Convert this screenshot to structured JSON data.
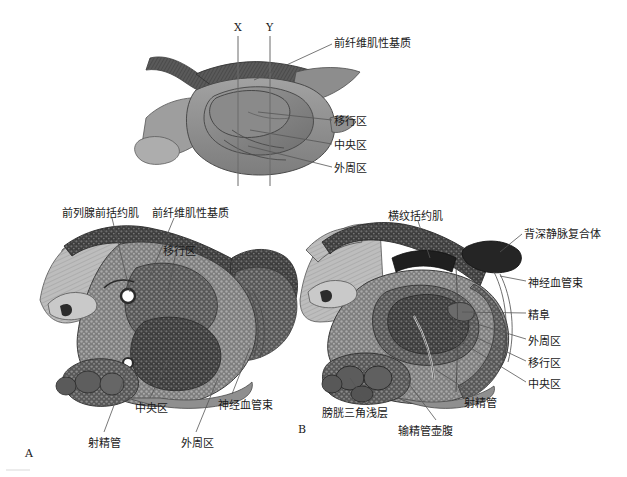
{
  "figure": {
    "title_zones": [
      "前纤维肌性基质",
      "移行区",
      "中央区",
      "外周区"
    ],
    "section_markers": {
      "x": "X",
      "y": "Y"
    },
    "panel_markers": {
      "a": "A",
      "b": "B"
    }
  },
  "top_panel": {
    "labels": [
      {
        "key": "afms",
        "text": "前纤维肌性基质",
        "x": 334,
        "y": 38
      },
      {
        "key": "transition",
        "text": "移行区",
        "x": 334,
        "y": 116
      },
      {
        "key": "central",
        "text": "中央区",
        "x": 334,
        "y": 140
      },
      {
        "key": "peripheral",
        "text": "外周区",
        "x": 334,
        "y": 163
      }
    ],
    "section_lines": [
      {
        "label": "X",
        "label_x": 234,
        "label_y": 26,
        "x": 238,
        "y1": 36,
        "y2": 186
      },
      {
        "label": "Y",
        "label_x": 266,
        "label_y": 26,
        "x": 270,
        "y1": 36,
        "y2": 186
      }
    ]
  },
  "panel_a": {
    "marker": "A",
    "marker_x": 25,
    "marker_y": 447,
    "labels": [
      {
        "key": "preprostatic-sphincter",
        "text": "前列腺前括约肌",
        "x": 62,
        "y": 208
      },
      {
        "key": "afms",
        "text": "前纤维肌性基质",
        "x": 152,
        "y": 208
      },
      {
        "key": "transition-zone",
        "text": "移行区",
        "x": 163,
        "y": 246
      },
      {
        "key": "central-zone",
        "text": "中央区",
        "x": 135,
        "y": 403
      },
      {
        "key": "neurovascular-bundle",
        "text": "神经血管束",
        "x": 218,
        "y": 400
      },
      {
        "key": "ejaculatory-duct",
        "text": "射精管",
        "x": 88,
        "y": 438
      },
      {
        "key": "peripheral-zone",
        "text": "外周区",
        "x": 181,
        "y": 438
      }
    ]
  },
  "panel_b": {
    "marker": "B",
    "marker_x": 298,
    "marker_y": 423,
    "labels": [
      {
        "key": "striated-sphincter",
        "text": "横纹括约肌",
        "x": 388,
        "y": 211
      },
      {
        "key": "dorsal-vein-complex",
        "text": "背深静脉复合体",
        "x": 524,
        "y": 229
      },
      {
        "key": "neurovascular-bundle",
        "text": "神经血管束",
        "x": 528,
        "y": 278
      },
      {
        "key": "verumontanum",
        "text": "精阜",
        "x": 528,
        "y": 310
      },
      {
        "key": "peripheral-zone",
        "text": "外周区",
        "x": 528,
        "y": 336
      },
      {
        "key": "transition-zone",
        "text": "移行区",
        "x": 528,
        "y": 358
      },
      {
        "key": "central-zone",
        "text": "中央区",
        "x": 528,
        "y": 379
      },
      {
        "key": "trigone-superficial",
        "text": "膀胱三角浅层",
        "x": 322,
        "y": 408
      },
      {
        "key": "ejaculatory-duct",
        "text": "射精管",
        "x": 464,
        "y": 398
      },
      {
        "key": "vas-ampulla",
        "text": "输精管壶腹",
        "x": 398,
        "y": 426
      }
    ]
  },
  "palette": {
    "background": "#ffffff",
    "ink": "#1a1a1a",
    "leader": "#5a5a5a",
    "tissue_light": "#c4c4c4",
    "tissue_mid": "#949494",
    "tissue_dark": "#4a4a4a",
    "tissue_darkest": "#2e2e2e",
    "zone_transition": "#8e8e8e",
    "zone_central": "#7a7a7a",
    "zone_peripheral": "#9c9c9c",
    "zone_afms": "#5e5e5e"
  },
  "footer_rule": {
    "visible": true,
    "x": 6,
    "y": 470,
    "width": 24
  }
}
